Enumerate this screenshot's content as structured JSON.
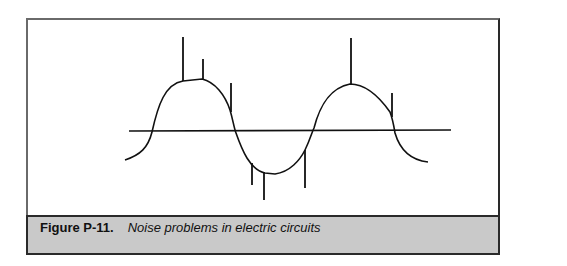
{
  "figure": {
    "label": "Figure P-11.",
    "title": "Noise problems in electric circuits"
  },
  "diagram": {
    "type": "waveform",
    "elements": [
      "baseline",
      "sine-wave",
      "noise-spikes"
    ],
    "colors": {
      "line": "#111111",
      "caption_bg": "#c9c9c9",
      "frame": "#2a2a2a"
    }
  }
}
